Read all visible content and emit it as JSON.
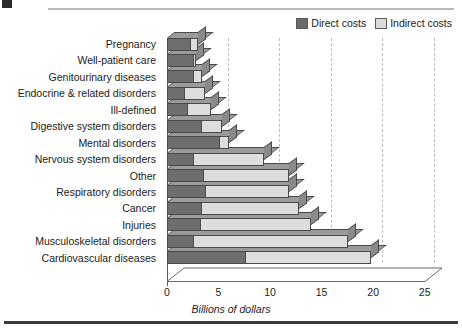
{
  "figure": {
    "legend": {
      "position": "top-right",
      "items": [
        {
          "label": "Direct costs",
          "color": "#6e6e6e",
          "icon": "legend-swatch-icon"
        },
        {
          "label": "Indirect costs",
          "color": "#dddddd",
          "icon": "legend-swatch-icon"
        }
      ]
    },
    "xaxis_label": "Billions of dollars",
    "xticks": [
      "0",
      "5",
      "10",
      "15",
      "20",
      "25"
    ]
  },
  "chart_data": {
    "type": "bar",
    "orientation": "horizontal",
    "stacked": true,
    "title": "",
    "subtitle": "",
    "xlabel": "Billions of dollars",
    "ylabel": "",
    "xlim": [
      0,
      25
    ],
    "xticks": [
      0,
      5,
      10,
      15,
      20,
      25
    ],
    "grid": "vertical-dashed",
    "legend_position": "top-right",
    "categories": [
      "Pregnancy",
      "Well-patient care",
      "Genitourinary diseases",
      "Endocrine & related disorders",
      "Ill-defined",
      "Digestive system disorders",
      "Mental disorders",
      "Nervous system disorders",
      "Other",
      "Respiratory disorders",
      "Cancer",
      "Injuries",
      "Musculoskeletal disorders",
      "Cardiovascular diseases"
    ],
    "series": [
      {
        "name": "Direct costs",
        "color": "#6e6e6e",
        "values": [
          2.3,
          2.6,
          2.6,
          1.7,
          2.0,
          3.4,
          5.1,
          2.6,
          3.6,
          3.8,
          3.4,
          3.3,
          2.6,
          7.7
        ]
      },
      {
        "name": "Indirect costs",
        "color": "#dddddd",
        "values": [
          0.7,
          0.2,
          0.8,
          2.0,
          2.3,
          1.9,
          0.9,
          6.8,
          8.2,
          8.0,
          9.4,
          10.7,
          15.0,
          12.1
        ]
      }
    ],
    "totals": [
      3.0,
      2.8,
      3.4,
      3.7,
      4.3,
      5.3,
      6.0,
      9.4,
      11.8,
      11.8,
      12.8,
      14.0,
      17.6,
      19.8
    ]
  }
}
